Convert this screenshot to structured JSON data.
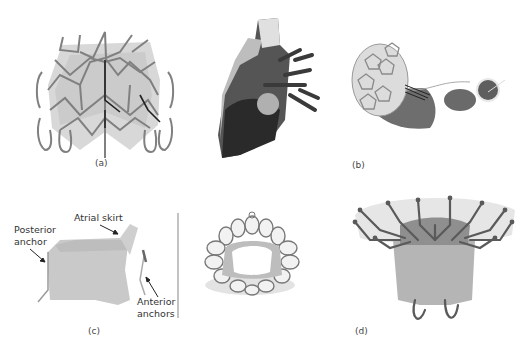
{
  "figure": {
    "panels": [
      {
        "id": "a",
        "label": "(a)",
        "subject": "transcatheter mitral valve frame with anchors"
      },
      {
        "id": "b",
        "label": "(b)",
        "subject": "valve with tethered apical pad"
      },
      {
        "id": "c",
        "label": "(c)",
        "subject": "valve side view and top view"
      },
      {
        "id": "d",
        "label": "(d)",
        "subject": "flared valve with wire arms and loop anchors"
      }
    ],
    "annotations": {
      "posterior_anchor": "Posterior\nanchor",
      "posterior_anchor_l1": "Posterior",
      "posterior_anchor_l2": "anchor",
      "atrial_skirt": "Atrial skirt",
      "anterior_anchors_l1": "Anterior",
      "anterior_anchors_l2": "anchors"
    },
    "colors": {
      "frame_wire": "#7a7a7a",
      "fabric_light": "#d9d9d9",
      "fabric_mid": "#bdbdbd",
      "heart_dark": "#3a3a3a",
      "divider": "#9a9a9a"
    }
  }
}
